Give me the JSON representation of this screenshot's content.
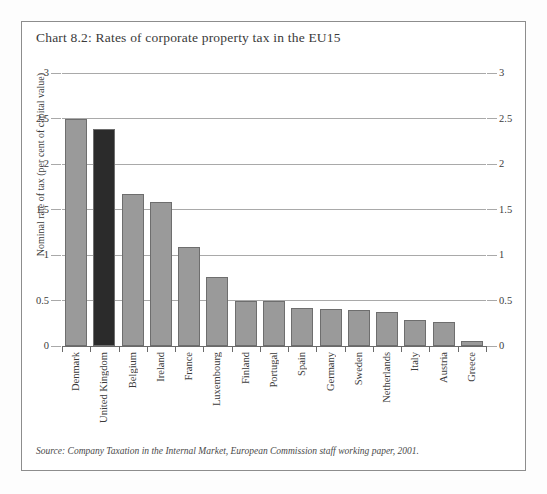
{
  "figure": {
    "title": "Chart 8.2: Rates of corporate property tax in the EU15",
    "source": "Source: Company Taxation in the Internal Market, European Commission staff working paper, 2001.",
    "frame_color": "#8d8d8d",
    "background": "#ffffff"
  },
  "chart_data": {
    "type": "bar",
    "title": "Chart 8.2: Rates of corporate property tax in the EU15",
    "xlabel": "",
    "ylabel": "Nominal rate of tax (per cent of capital value)",
    "ylim": [
      0,
      3
    ],
    "yticks": [
      0,
      0.5,
      1,
      1.5,
      2,
      2.5,
      3
    ],
    "ytick_labels": [
      "0",
      "0.5",
      "1",
      "1.5",
      "2",
      "2.5",
      "3"
    ],
    "grid": true,
    "legend": "none",
    "dual_axis": true,
    "categories": [
      "Denmark",
      "United Kingdom",
      "Belgium",
      "Ireland",
      "France",
      "Luxembourg",
      "Finland",
      "Portugal",
      "Spain",
      "Germany",
      "Sweden",
      "Netherlands",
      "Italy",
      "Austria",
      "Greece"
    ],
    "values": [
      2.5,
      2.38,
      1.67,
      1.58,
      1.09,
      0.76,
      0.5,
      0.5,
      0.42,
      0.41,
      0.4,
      0.37,
      0.29,
      0.26,
      0.05
    ],
    "bar_colors": [
      "#9a9a9a",
      "#2b2b2b",
      "#9a9a9a",
      "#9a9a9a",
      "#9a9a9a",
      "#9a9a9a",
      "#9a9a9a",
      "#9a9a9a",
      "#9a9a9a",
      "#9a9a9a",
      "#9a9a9a",
      "#9a9a9a",
      "#9a9a9a",
      "#9a9a9a",
      "#9a9a9a"
    ],
    "highlight_category": "United Kingdom",
    "highlight_color": "#2b2b2b",
    "default_bar_color": "#9a9a9a",
    "bar_edge_color": "#6e6e6e",
    "gridline_color": "#a9a9a9",
    "axis_color": "#6a6a6a"
  }
}
